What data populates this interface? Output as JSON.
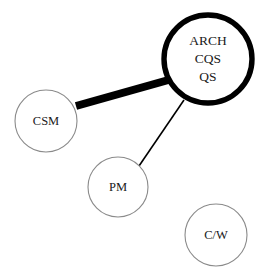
{
  "diagram": {
    "type": "node-link-network",
    "background_color": "#ffffff",
    "width": 266,
    "height": 273,
    "nodes": [
      {
        "id": "arch",
        "labels": [
          "ARCH",
          "CQS",
          "QS"
        ],
        "label_text": "ARCH CQS QS",
        "cx": 208,
        "cy": 59,
        "r": 44,
        "emphasis": "thick",
        "stroke_color": "#000000",
        "stroke_width": 5.4,
        "fill_color": "#ffffff",
        "font_size": 13.5
      },
      {
        "id": "csm",
        "labels": [
          "CSM"
        ],
        "label_text": "CSM",
        "cx": 46,
        "cy": 121,
        "r": 31,
        "emphasis": "thin",
        "stroke_color": "#8a8a8a",
        "stroke_width": 1.1,
        "fill_color": "#ffffff",
        "font_size": 12.5
      },
      {
        "id": "pm",
        "labels": [
          "PM"
        ],
        "label_text": "PM",
        "cx": 118,
        "cy": 187,
        "r": 30,
        "emphasis": "thin",
        "stroke_color": "#8a8a8a",
        "stroke_width": 1.1,
        "fill_color": "#ffffff",
        "font_size": 12.5
      },
      {
        "id": "cw",
        "labels": [
          "C/W"
        ],
        "label_text": "C/W",
        "cx": 216,
        "cy": 235,
        "r": 31,
        "emphasis": "thin",
        "stroke_color": "#8a8a8a",
        "stroke_width": 1.1,
        "fill_color": "#ffffff",
        "font_size": 12.5
      }
    ],
    "edges": [
      {
        "id": "csm-arch",
        "source": "csm",
        "target": "arch",
        "x1": 76,
        "y1": 106,
        "x2": 172,
        "y2": 79,
        "weight": "heavy",
        "stroke_width": 8,
        "stroke_color": "#000000"
      },
      {
        "id": "pm-arch",
        "source": "pm",
        "target": "arch",
        "x1": 139,
        "y1": 166,
        "x2": 184,
        "y2": 100,
        "weight": "light",
        "stroke_width": 1.6,
        "stroke_color": "#000000"
      }
    ],
    "isolated_nodes": [
      "cw"
    ]
  }
}
